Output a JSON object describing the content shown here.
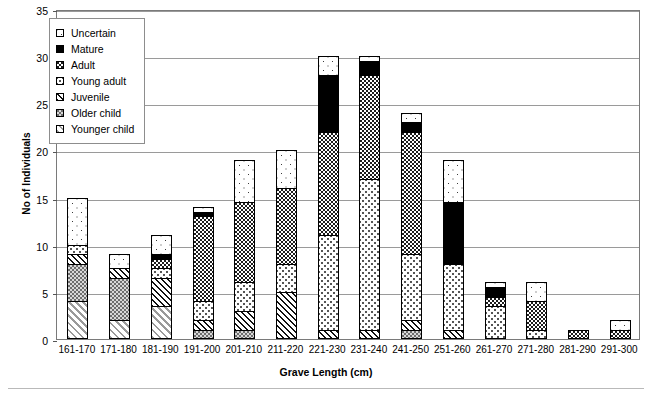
{
  "chart_data": {
    "type": "bar",
    "stacked": true,
    "title": "",
    "xlabel": "Grave Length (cm)",
    "ylabel": "No of Individuals",
    "ylim": [
      0,
      35
    ],
    "ytick_step": 5,
    "yticks": [
      0,
      5,
      10,
      15,
      20,
      25,
      30,
      35
    ],
    "grid": true,
    "legend_position": "upper-left-inside",
    "categories": [
      "161-170",
      "171-180",
      "181-190",
      "191-200",
      "201-210",
      "211-220",
      "221-230",
      "231-240",
      "241-250",
      "251-260",
      "261-270",
      "271-280",
      "281-290",
      "291-300"
    ],
    "series": [
      {
        "name": "Younger child",
        "pattern": "p-youngerchild",
        "values": [
          4,
          2,
          3.5,
          0,
          0,
          0,
          0,
          0,
          0,
          0,
          0,
          0,
          0,
          0
        ]
      },
      {
        "name": "Older child",
        "pattern": "p-olderchild",
        "values": [
          4,
          4.5,
          0,
          1,
          1,
          0,
          0,
          0,
          1,
          0,
          0,
          0,
          0,
          0
        ]
      },
      {
        "name": "Juvenile",
        "pattern": "p-juvenile",
        "values": [
          1,
          1,
          3,
          1,
          2,
          5,
          1,
          1,
          1,
          1,
          0,
          0,
          0,
          0
        ]
      },
      {
        "name": "Young adult",
        "pattern": "p-youngadult",
        "values": [
          1,
          0,
          1,
          2,
          3,
          3,
          10,
          16,
          7,
          7,
          3.5,
          1,
          0,
          0
        ]
      },
      {
        "name": "Adult",
        "pattern": "p-adult",
        "values": [
          0,
          0,
          1,
          9,
          8.5,
          8,
          11,
          11,
          13,
          0,
          1,
          3,
          1,
          1
        ]
      },
      {
        "name": "Mature",
        "pattern": "p-mature",
        "values": [
          0,
          0,
          0.5,
          0.5,
          0,
          0,
          6,
          1.5,
          1,
          6.5,
          1,
          0,
          0,
          0
        ]
      },
      {
        "name": "Uncertain",
        "pattern": "p-uncertain",
        "values": [
          5,
          1.5,
          2,
          0.5,
          4.5,
          4,
          2,
          0.5,
          1,
          4.5,
          0.5,
          2,
          0,
          1
        ]
      }
    ],
    "totals": [
      15,
      9,
      11,
      14,
      19,
      20,
      30,
      30,
      24,
      19,
      6,
      6,
      1,
      2
    ]
  },
  "legend": {
    "items": [
      {
        "label": "Uncertain",
        "pattern": "p-uncertain"
      },
      {
        "label": "Mature",
        "pattern": "p-mature"
      },
      {
        "label": "Adult",
        "pattern": "p-adult"
      },
      {
        "label": "Young adult",
        "pattern": "p-youngadult"
      },
      {
        "label": "Juvenile",
        "pattern": "p-juvenile"
      },
      {
        "label": "Older child",
        "pattern": "p-olderchild"
      },
      {
        "label": "Younger child",
        "pattern": "p-youngerchild"
      }
    ]
  },
  "colors": {
    "frame": "#7a7a7a",
    "gridline": "#9a9a9a",
    "text": "#000000",
    "background": "#ffffff"
  }
}
